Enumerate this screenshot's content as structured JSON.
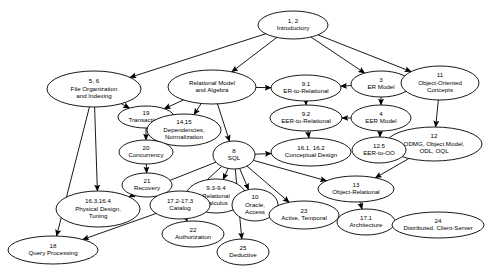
{
  "diagram": {
    "type": "directed-graph",
    "width": 485,
    "height": 279,
    "background_color": "#ffffff",
    "stroke_color": "#000000",
    "nodes": [
      {
        "id": "n1",
        "number": "1, 2",
        "lines": [
          "Introductory"
        ],
        "cx": 293,
        "cy": 25,
        "rx": 35,
        "ry": 14
      },
      {
        "id": "n2",
        "number": "5, 6",
        "lines": [
          "File Organization",
          "and Indexing"
        ],
        "cx": 94,
        "cy": 89,
        "rx": 47,
        "ry": 18
      },
      {
        "id": "n3",
        "number": "",
        "lines": [
          "Relational Model",
          "and Algebra"
        ],
        "cx": 212,
        "cy": 87,
        "rx": 44,
        "ry": 17
      },
      {
        "id": "n4",
        "number": "9.1",
        "lines": [
          "ER-to-Relational"
        ],
        "cx": 306,
        "cy": 88,
        "rx": 35,
        "ry": 13
      },
      {
        "id": "n5",
        "number": "3",
        "lines": [
          "ER Model"
        ],
        "cx": 381,
        "cy": 84,
        "rx": 30,
        "ry": 13
      },
      {
        "id": "n6",
        "number": "11",
        "lines": [
          "Object-Oriented",
          "Concepts"
        ],
        "cx": 440,
        "cy": 83,
        "rx": 39,
        "ry": 17
      },
      {
        "id": "n7",
        "number": "19",
        "lines": [
          "Transactions"
        ],
        "cx": 146,
        "cy": 117,
        "rx": 28,
        "ry": 11
      },
      {
        "id": "n8",
        "number": "14,15",
        "lines": [
          "Dependencies,",
          "Normalization"
        ],
        "cx": 184,
        "cy": 130,
        "rx": 37,
        "ry": 16
      },
      {
        "id": "n9",
        "number": "9.2",
        "lines": [
          "EER-to-Relational"
        ],
        "cx": 306,
        "cy": 118,
        "rx": 36,
        "ry": 13
      },
      {
        "id": "n10",
        "number": "4",
        "lines": [
          "EER Model"
        ],
        "cx": 381,
        "cy": 118,
        "rx": 30,
        "ry": 13
      },
      {
        "id": "n11",
        "number": "12",
        "lines": [
          "ODMG, Object Model,",
          "ODL, OQL"
        ],
        "cx": 434,
        "cy": 144,
        "rx": 48,
        "ry": 17
      },
      {
        "id": "n12",
        "number": "16.1, 16.2",
        "lines": [
          "Conceptual Design"
        ],
        "cx": 311,
        "cy": 152,
        "rx": 40,
        "ry": 14
      },
      {
        "id": "n13",
        "number": "12.5",
        "lines": [
          "EER-to-OO"
        ],
        "cx": 379,
        "cy": 150,
        "rx": 27,
        "ry": 13
      },
      {
        "id": "n14",
        "number": "8",
        "lines": [
          "SQL"
        ],
        "cx": 234,
        "cy": 155,
        "rx": 21,
        "ry": 14
      },
      {
        "id": "n15",
        "number": "20",
        "lines": [
          "Concurrency"
        ],
        "cx": 146,
        "cy": 152,
        "rx": 27,
        "ry": 12
      },
      {
        "id": "n16",
        "number": "13",
        "lines": [
          "Object-Relational"
        ],
        "cx": 356,
        "cy": 189,
        "rx": 38,
        "ry": 13
      },
      {
        "id": "n17",
        "number": "21",
        "lines": [
          "Recovery"
        ],
        "cx": 147,
        "cy": 185,
        "rx": 25,
        "ry": 12
      },
      {
        "id": "n18",
        "number": "9.3-9.4",
        "lines": [
          "Relational",
          "Calculus"
        ],
        "cx": 216,
        "cy": 196,
        "rx": 30,
        "ry": 17
      },
      {
        "id": "n19",
        "number": "17.2-17.3",
        "lines": [
          "Catalog"
        ],
        "cx": 180,
        "cy": 205,
        "rx": 30,
        "ry": 14
      },
      {
        "id": "n20",
        "number": "16.3,16.4",
        "lines": [
          "Physical Design,",
          "Tuning"
        ],
        "cx": 98,
        "cy": 209,
        "rx": 42,
        "ry": 18
      },
      {
        "id": "n21",
        "number": "10",
        "lines": [
          "Oracle,",
          "Access"
        ],
        "cx": 255,
        "cy": 205,
        "rx": 23,
        "ry": 16
      },
      {
        "id": "n22",
        "number": "23",
        "lines": [
          "Active, Temporal"
        ],
        "cx": 304,
        "cy": 215,
        "rx": 35,
        "ry": 14
      },
      {
        "id": "n23",
        "number": "17.1",
        "lines": [
          "Architecture"
        ],
        "cx": 366,
        "cy": 222,
        "rx": 29,
        "ry": 13
      },
      {
        "id": "n24",
        "number": "24",
        "lines": [
          "Distributed, Client-Server"
        ],
        "cx": 438,
        "cy": 225,
        "rx": 46,
        "ry": 13
      },
      {
        "id": "n25",
        "number": "22",
        "lines": [
          "Authorization"
        ],
        "cx": 193,
        "cy": 234,
        "rx": 31,
        "ry": 13
      },
      {
        "id": "n26",
        "number": "25",
        "lines": [
          "Deductive"
        ],
        "cx": 243,
        "cy": 252,
        "rx": 26,
        "ry": 13
      },
      {
        "id": "n27",
        "number": "18",
        "lines": [
          "Query Processing"
        ],
        "cx": 53,
        "cy": 250,
        "rx": 45,
        "ry": 14
      }
    ],
    "edges": [
      {
        "from": "n1",
        "to": "n2"
      },
      {
        "from": "n1",
        "to": "n3"
      },
      {
        "from": "n1",
        "to": "n5"
      },
      {
        "from": "n1",
        "to": "n6"
      },
      {
        "from": "n2",
        "to": "n7"
      },
      {
        "from": "n2",
        "to": "n20"
      },
      {
        "from": "n2",
        "to": "n27"
      },
      {
        "from": "n3",
        "to": "n7"
      },
      {
        "from": "n3",
        "to": "n8"
      },
      {
        "from": "n3",
        "to": "n4"
      },
      {
        "from": "n3",
        "to": "n14"
      },
      {
        "from": "n5",
        "to": "n4"
      },
      {
        "from": "n5",
        "to": "n10"
      },
      {
        "from": "n10",
        "to": "n9"
      },
      {
        "from": "n10",
        "to": "n13"
      },
      {
        "from": "n4",
        "to": "n9"
      },
      {
        "from": "n9",
        "to": "n12"
      },
      {
        "from": "n6",
        "to": "n11"
      },
      {
        "from": "n11",
        "to": "n16"
      },
      {
        "from": "n14",
        "to": "n12"
      },
      {
        "from": "n14",
        "to": "n18"
      },
      {
        "from": "n14",
        "to": "n19"
      },
      {
        "from": "n14",
        "to": "n20"
      },
      {
        "from": "n14",
        "to": "n21"
      },
      {
        "from": "n14",
        "to": "n22"
      },
      {
        "from": "n14",
        "to": "n16"
      },
      {
        "from": "n14",
        "to": "n26"
      },
      {
        "from": "n7",
        "to": "n15"
      },
      {
        "from": "n15",
        "to": "n17"
      },
      {
        "from": "n19",
        "to": "n25"
      },
      {
        "from": "n19",
        "to": "n27"
      },
      {
        "from": "n16",
        "to": "n23"
      },
      {
        "from": "n23",
        "to": "n24"
      }
    ]
  }
}
